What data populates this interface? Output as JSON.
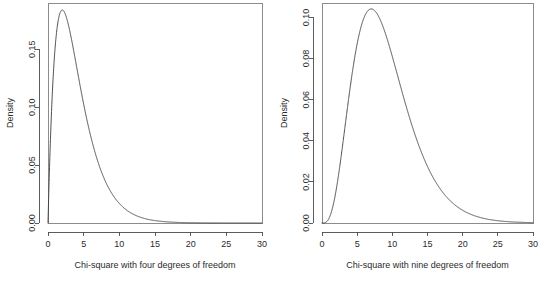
{
  "figure": {
    "background": "#ffffff",
    "line_color": "#3c3c3c",
    "axis_color": "#4a4a4a",
    "box_color": "#8c8c8c",
    "panels": 2
  },
  "chart_data": [
    {
      "type": "line",
      "title": "",
      "subtitle": "",
      "xlabel": "Chi-square with four degrees of freedom",
      "ylabel": "Density",
      "xlim": [
        0,
        30
      ],
      "ylim": [
        0,
        0.19
      ],
      "grid": false,
      "legend": null,
      "xticks": [
        0,
        5,
        10,
        15,
        20,
        25,
        30
      ],
      "xticklabels": [
        "0",
        "5",
        "10",
        "15",
        "20",
        "25",
        "30"
      ],
      "yticks": [
        0.0,
        0.05,
        0.1,
        0.15
      ],
      "yticklabels": [
        "0.00",
        "0.05",
        "0.10",
        "0.15"
      ],
      "series": [
        {
          "name": "chi-square df=4 density",
          "df": 4,
          "x": [
            0,
            0.25,
            0.5,
            0.75,
            1,
            1.25,
            1.5,
            1.75,
            2,
            2.25,
            2.5,
            2.75,
            3,
            3.25,
            3.5,
            3.75,
            4,
            4.5,
            5,
            5.5,
            6,
            6.5,
            7,
            7.5,
            8,
            8.5,
            9,
            9.5,
            10,
            11,
            12,
            13,
            14,
            15,
            16,
            17,
            18,
            19,
            20,
            22,
            24,
            26,
            28,
            30
          ],
          "y": [
            0.0,
            0.1103,
            0.1947,
            0.2579,
            0.1516,
            0.1742,
            0.1771,
            0.1822,
            0.1839,
            0.1828,
            0.1795,
            0.1744,
            0.1673,
            0.1605,
            0.1528,
            0.1448,
            0.1353,
            0.1186,
            0.1026,
            0.0877,
            0.0747,
            0.0628,
            0.0527,
            0.0439,
            0.0366,
            0.0303,
            0.025,
            0.0206,
            0.0168,
            0.0111,
            0.0074,
            0.0049,
            0.0032,
            0.0021,
            0.0013,
            0.00087,
            0.00056,
            0.00036,
            0.00023,
            9e-05,
            4e-05,
            1.4e-05,
            5e-06,
            2e-06
          ]
        }
      ],
      "annotations": {
        "peak_x": 2,
        "peak_y": 0.1839
      }
    },
    {
      "type": "line",
      "title": "",
      "subtitle": "",
      "xlabel": "Chi-square with nine degrees of freedom",
      "ylabel": "Density",
      "xlim": [
        0,
        30
      ],
      "ylim": [
        0,
        0.107
      ],
      "grid": false,
      "legend": null,
      "xticks": [
        0,
        5,
        10,
        15,
        20,
        25,
        30
      ],
      "xticklabels": [
        "0",
        "5",
        "10",
        "15",
        "20",
        "25",
        "30"
      ],
      "yticks": [
        0.0,
        0.02,
        0.04,
        0.06,
        0.08,
        0.1
      ],
      "yticklabels": [
        "0.00",
        "0.02",
        "0.04",
        "0.06",
        "0.08",
        "0.10"
      ],
      "series": [
        {
          "name": "chi-square df=9 density",
          "df": 9,
          "x": [
            0,
            0.5,
            1,
            1.5,
            2,
            2.5,
            3,
            3.5,
            4,
            4.5,
            5,
            5.5,
            6,
            6.5,
            7,
            7.5,
            8,
            8.5,
            9,
            9.5,
            10,
            11,
            12,
            13,
            14,
            15,
            16,
            17,
            18,
            19,
            20,
            21,
            22,
            23,
            24,
            25,
            26,
            27,
            28,
            29,
            30
          ],
          "y": [
            0.0,
            0.0015,
            0.0072,
            0.017,
            0.0298,
            0.0438,
            0.0573,
            0.0693,
            0.0789,
            0.086,
            0.0906,
            0.0929,
            0.0932,
            0.0918,
            0.0891,
            0.0853,
            0.0807,
            0.0756,
            0.0701,
            0.0645,
            0.0587,
            0.0474,
            0.0371,
            0.0284,
            0.0212,
            0.0155,
            0.0111,
            0.0078,
            0.0054,
            0.0037,
            0.0025,
            0.0017,
            0.0011,
            0.00073,
            0.00047,
            0.0003,
            0.00019,
            0.00012,
            8e-05,
            5e-05,
            3e-05
          ]
        }
      ],
      "annotations": {
        "peak_x": 7,
        "peak_y": 0.1032
      }
    }
  ]
}
